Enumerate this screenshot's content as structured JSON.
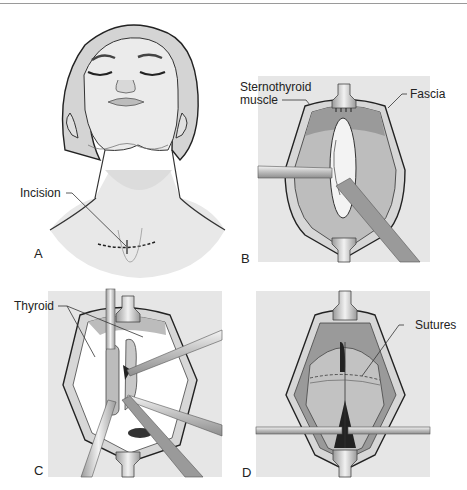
{
  "figure": {
    "panels": [
      {
        "id": "A",
        "label": "A",
        "annotations": [
          "Incision"
        ]
      },
      {
        "id": "B",
        "label": "B",
        "annotations": [
          "Sternothyroid muscle",
          "Fascia"
        ]
      },
      {
        "id": "C",
        "label": "C",
        "annotations": [
          "Thyroid"
        ]
      },
      {
        "id": "D",
        "label": "D",
        "annotations": [
          "Sutures"
        ]
      }
    ],
    "labels": {
      "incision": "Incision",
      "sternothyroid_line1": "Sternothyroid",
      "sternothyroid_line2": "muscle",
      "fascia": "Fascia",
      "thyroid": "Thyroid",
      "sutures": "Sutures"
    },
    "colors": {
      "panel_bg": "#e6e6e6",
      "skin": "#e9e9e9",
      "cap": "#d6d6d6",
      "muscle": "#b9b9b9",
      "dark_muscle": "#8c8c8c",
      "outline": "#222222"
    }
  }
}
